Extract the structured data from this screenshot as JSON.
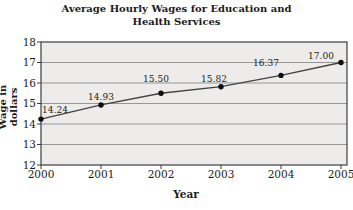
{
  "chart_data": {
    "type": "line",
    "title": "Average Hourly Wages for Education and Health Services",
    "title_lines": [
      "Average Hourly Wages for Education and",
      "Health Services"
    ],
    "xlabel": "Year",
    "ylabel": "Wage in dollars",
    "x": [
      2000,
      2001,
      2002,
      2003,
      2004,
      2005
    ],
    "values": [
      14.24,
      14.93,
      15.5,
      15.82,
      16.37,
      17.0
    ],
    "point_labels": [
      "14.24",
      "14.93",
      "15.50",
      "15.82",
      "16.37",
      "17.00"
    ],
    "ylim": [
      12,
      18
    ],
    "yticks": [
      12,
      13,
      14,
      15,
      16,
      17,
      18
    ],
    "grid": "horizontal-major",
    "legend": "none",
    "colors": {
      "background": "#ffffff",
      "plot_fill": "#edecea",
      "grid_line": "#979797",
      "axis_line": "#3d3d3d",
      "series_line": "#424242",
      "marker": "#0d0d0d",
      "text": "#1c1c1c"
    }
  }
}
